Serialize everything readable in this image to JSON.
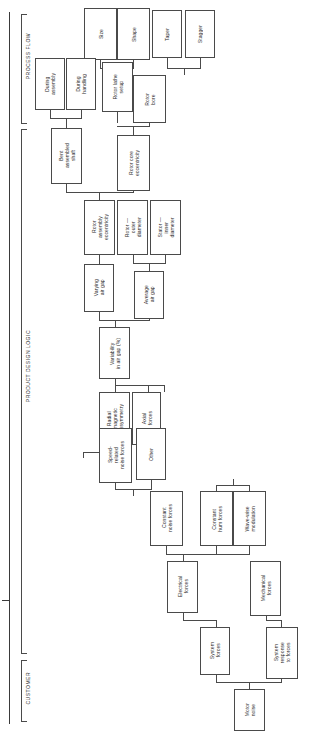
{
  "diagram": {
    "sections": [
      {
        "id": "process-flow",
        "label": "PROCESS FLOW"
      },
      {
        "id": "product-design-logic",
        "label": "PRODUCT DESIGN LOGIC"
      },
      {
        "id": "customer",
        "label": "CUSTOMER"
      }
    ],
    "nodes": [
      {
        "id": "size",
        "label": "Size"
      },
      {
        "id": "shape",
        "label": "Shape"
      },
      {
        "id": "taper",
        "label": "Taper"
      },
      {
        "id": "stagger",
        "label": "Stagger"
      },
      {
        "id": "during-assembly",
        "label": "During\nassembly"
      },
      {
        "id": "during-handling",
        "label": "During\nhandling"
      },
      {
        "id": "rotor-lathe-setup",
        "label": "Rotor lathe\nsetup"
      },
      {
        "id": "rotor-bore",
        "label": "Rotor\nbore"
      },
      {
        "id": "bent-assembled-shaft",
        "label": "Bent\nassembled\nshaft"
      },
      {
        "id": "rotor-core-eccentricity",
        "label": "Rotor core\neccentricity"
      },
      {
        "id": "rotor-assembly-eccentricity",
        "label": "Rotor\nassembly\neccentricity"
      },
      {
        "id": "rotor-outer-diameter",
        "label": "Rotor —\nouter\ndiameter"
      },
      {
        "id": "stator-inner-diameter",
        "label": "Stator —\ninner\ndiameter"
      },
      {
        "id": "varying-air-gap",
        "label": "Varying\nair gap"
      },
      {
        "id": "average-air-gap",
        "label": "Average\nair gap"
      },
      {
        "id": "variability-in-air-gap",
        "label": "Variability\nin air gap (%)"
      },
      {
        "id": "radial-magnetic-dissymmetry",
        "label": "Radial\nmagnetic\ndissymmetry"
      },
      {
        "id": "axial-forces",
        "label": "Axial\nforces"
      },
      {
        "id": "speed-related-noise-forces",
        "label": "Speed-\nrelated\nnoise forces"
      },
      {
        "id": "other",
        "label": "Other"
      },
      {
        "id": "constant-noise-forces",
        "label": "Constant\nnoise forces"
      },
      {
        "id": "constant-hum-forces",
        "label": "Constant\nhum forces"
      },
      {
        "id": "wave-wise-modulation",
        "label": "Wave-wise\nmodulation"
      },
      {
        "id": "electrical-forces",
        "label": "Electrical\nforces"
      },
      {
        "id": "mechanical-forces",
        "label": "Mechanical\nforces"
      },
      {
        "id": "system-forces",
        "label": "System\nforces"
      },
      {
        "id": "system-response-to-forces",
        "label": "System\nresponse\nto forces"
      },
      {
        "id": "motor-noise",
        "label": "Motor\nnoise"
      }
    ],
    "colors": {
      "line": "#4a4a4a",
      "box_fill": "#ffffff",
      "text": "#2b2b2b",
      "background": "#ffffff"
    }
  }
}
